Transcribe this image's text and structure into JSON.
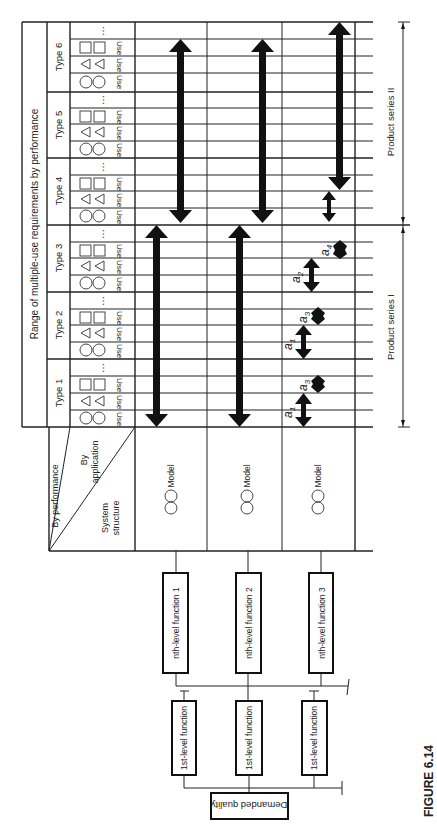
{
  "figure": {
    "caption": "FIGURE 6.14",
    "title_band": "Range of multiple-use requirements by performance",
    "corner_header": {
      "by_performance": "By performance",
      "by_application_line1": "By",
      "by_application_line2": "application",
      "system_structure_line1": "System",
      "system_structure_line2": "structure"
    },
    "types": [
      {
        "label": "Type 6",
        "uses": [
          "Use",
          "Use",
          "Use"
        ],
        "ellipsis": "…"
      },
      {
        "label": "Type 5",
        "uses": [
          "Use",
          "Use",
          "Use"
        ],
        "ellipsis": "…"
      },
      {
        "label": "Type 4",
        "uses": [
          "Use",
          "Use",
          "Use"
        ],
        "ellipsis": "…"
      },
      {
        "label": "Type 3",
        "uses": [
          "Use",
          "Use",
          "Use"
        ],
        "ellipsis": "…"
      },
      {
        "label": "Type 2",
        "uses": [
          "Use",
          "Use",
          "Use"
        ],
        "ellipsis": "…"
      },
      {
        "label": "Type 1",
        "uses": [
          "Use",
          "Use",
          "Use"
        ],
        "ellipsis": "…"
      }
    ],
    "use_symbols": [
      "circle-pair-icon",
      "triangle-pair-icon",
      "square-pair-icon"
    ],
    "models": [
      {
        "label": "Model",
        "symbol": "circle-pair-icon"
      },
      {
        "label": "Model",
        "symbol": "circle-pair-icon"
      },
      {
        "label": "Model",
        "symbol": "circle-pair-icon"
      }
    ],
    "nth_level_functions": [
      "nth-level function 1",
      "nth-level function 2",
      "nth-level function 3"
    ],
    "first_level_functions": [
      "1st-level function",
      "1st-level function",
      "1st-level function"
    ],
    "root": "Demanded quality",
    "product_series": [
      {
        "label": "Product series II",
        "covers_types": [
          "Type 4",
          "Type 5",
          "Type 6"
        ]
      },
      {
        "label": "Product series I",
        "covers_types": [
          "Type 1",
          "Type 2",
          "Type 3"
        ]
      }
    ],
    "subscript_labels": [
      {
        "base": "a",
        "sub": "1"
      },
      {
        "base": "a",
        "sub": "3"
      },
      {
        "base": "a",
        "sub": "1"
      },
      {
        "base": "a",
        "sub": "3"
      },
      {
        "base": "a",
        "sub": "2"
      },
      {
        "base": "a",
        "sub": "4"
      }
    ]
  }
}
